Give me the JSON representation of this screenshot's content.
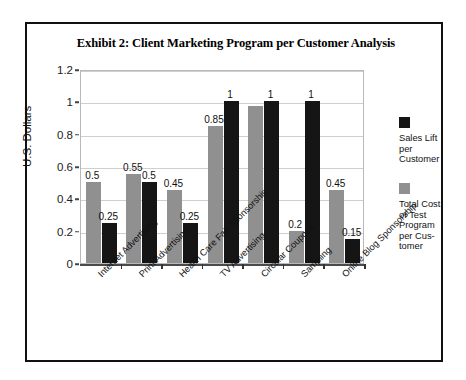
{
  "exhibit": {
    "title": "Exhibit 2: Client Marketing Program per Customer Analysis"
  },
  "chart_data": {
    "type": "bar",
    "title": "Exhibit 2: Client Marketing Program per Customer Analysis",
    "xlabel": "",
    "ylabel": "U.S. Dollars",
    "ylim": [
      0,
      1.2
    ],
    "ytick_labels": [
      "1.2",
      "1",
      "0.8",
      "0.6",
      "0.4",
      "0.2",
      "0"
    ],
    "ytick_values": [
      1.2,
      1,
      0.8,
      0.6,
      0.4,
      0.2,
      0
    ],
    "grid": true,
    "legend_position": "right",
    "categories": [
      "Internet Advertising",
      "Print Advertising",
      "Health Care Fair Sponsorship",
      "TV Advertising",
      "Circular Coupons",
      "Sampling",
      "Online Blog Sponsorship"
    ],
    "series": [
      {
        "name": "Total Cost of Test Program per Cus-tomer",
        "color": "#909090",
        "values": [
          0.5,
          0.55,
          0.45,
          0.85,
          0.97,
          0.2,
          0.45
        ],
        "labels": [
          "0.5",
          "0.55",
          "0.45",
          "0.85",
          "",
          "0.2",
          "0.45"
        ]
      },
      {
        "name": "Sales Lift per Customer",
        "color": "#151515",
        "values": [
          0.25,
          0.5,
          0.25,
          1,
          1,
          1,
          0.15
        ],
        "labels": [
          "0.25",
          "0.5",
          "0.25",
          "1",
          "1",
          "1",
          "0.15"
        ]
      }
    ]
  },
  "legend": {
    "entries": [
      {
        "label": "Sales Lift per Customer",
        "swatch": "lift"
      },
      {
        "label": "Total Cost of Test Program per Cus-tomer",
        "swatch": "cost"
      }
    ]
  }
}
